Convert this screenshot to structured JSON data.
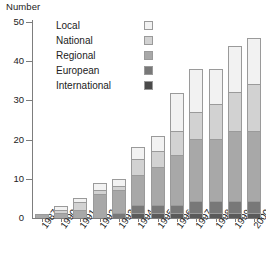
{
  "chart_data": {
    "type": "bar",
    "subtype": "stacked-vertical",
    "title": "",
    "ylabel": "Number",
    "xlabel": "",
    "ylim": [
      0,
      50
    ],
    "yticks": [
      0,
      10,
      20,
      30,
      40,
      50
    ],
    "ytick_labels": [
      "0",
      "10",
      "20",
      "30",
      "40",
      "50"
    ],
    "grid": false,
    "legend_position": "top-left-inside",
    "categories": [
      "1987",
      "1990",
      "1991",
      "1992",
      "1993",
      "1994",
      "1995",
      "1996",
      "1997",
      "1998",
      "1999",
      "2000"
    ],
    "series": [
      {
        "name": "International",
        "color": "#5a5a5a",
        "values": [
          0,
          0,
          0,
          0,
          0,
          1,
          1,
          1,
          1,
          1,
          1,
          1
        ]
      },
      {
        "name": "European",
        "color": "#787878",
        "values": [
          0,
          0,
          0,
          0,
          1,
          2,
          2,
          2,
          3,
          3,
          3,
          3
        ]
      },
      {
        "name": "Regional",
        "color": "#a8a8a8",
        "values": [
          1,
          1,
          2,
          6,
          6,
          8,
          10,
          13,
          16,
          16,
          18,
          18
        ]
      },
      {
        "name": "National",
        "color": "#d2d2d2",
        "values": [
          0,
          1,
          2,
          1,
          1,
          4,
          4,
          6,
          7,
          9,
          10,
          12
        ]
      },
      {
        "name": "Local",
        "color": "#f2f2f2",
        "values": [
          0,
          1,
          1,
          2,
          2,
          3,
          4,
          10,
          11,
          9,
          12,
          12
        ]
      }
    ],
    "totals": [
      1,
      3,
      5,
      9,
      10,
      18,
      21,
      32,
      38,
      38,
      44,
      46
    ],
    "legend_entries": [
      {
        "label": "Local",
        "color": "#f2f2f2"
      },
      {
        "label": "National",
        "color": "#d2d2d2"
      },
      {
        "label": "Regional",
        "color": "#a8a8a8"
      },
      {
        "label": "European",
        "color": "#787878"
      },
      {
        "label": "International",
        "color": "#4a4a4a"
      }
    ]
  },
  "axis": {
    "axis_color": "#7d7d7d",
    "bar_border_color": "#9a9a9a"
  }
}
